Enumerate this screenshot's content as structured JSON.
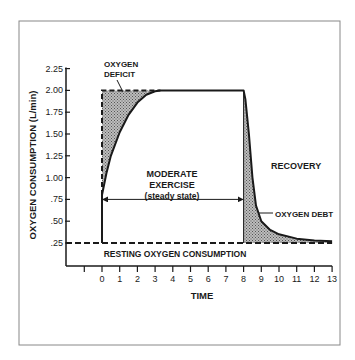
{
  "chart_data": {
    "type": "line",
    "title": "",
    "xlabel": "TIME",
    "ylabel": "OXYGEN CONSUMPTION (L/min)",
    "xlim": [
      -1,
      13
    ],
    "ylim": [
      0,
      2.25
    ],
    "x_ticks": [
      -1,
      0,
      1,
      2,
      3,
      4,
      5,
      6,
      7,
      8,
      9,
      10,
      11,
      12,
      13
    ],
    "x_tick_labels": [
      "",
      "0",
      "1",
      "2",
      "3",
      "4",
      "5",
      "6",
      "7",
      "8",
      "9",
      "10",
      "11",
      "12",
      "13"
    ],
    "y_ticks": [
      0.25,
      0.5,
      0.75,
      1.0,
      1.25,
      1.5,
      1.75,
      2.0,
      2.25
    ],
    "y_tick_labels": [
      ".25",
      ".50",
      ".75",
      "1.00",
      "1.25",
      "1.50",
      "1.75",
      "2.00",
      "2.25"
    ],
    "grid": false,
    "series": [
      {
        "name": "Oxygen consumption",
        "x": [
          0,
          0,
          0.25,
          0.5,
          1,
          1.5,
          2,
          2.5,
          3,
          3.3,
          8,
          8.1,
          8.3,
          8.5,
          8.7,
          9,
          9.5,
          10,
          11,
          12,
          13
        ],
        "y": [
          0.25,
          0.8,
          1.05,
          1.25,
          1.52,
          1.72,
          1.86,
          1.95,
          1.99,
          2.0,
          2.0,
          1.9,
          1.5,
          1.0,
          0.68,
          0.5,
          0.4,
          0.35,
          0.3,
          0.28,
          0.27
        ]
      },
      {
        "name": "Steady-state demand (dashed)",
        "x": [
          0,
          0,
          3.3
        ],
        "y": [
          0.25,
          2.0,
          2.0
        ]
      },
      {
        "name": "Resting oxygen consumption (dashed)",
        "x": [
          -1,
          13
        ],
        "y": [
          0.25,
          0.25
        ]
      }
    ],
    "shaded_regions": [
      {
        "name": "Oxygen deficit",
        "x_range": [
          0,
          3.3
        ]
      },
      {
        "name": "Oxygen debt",
        "x_range": [
          8,
          13
        ]
      }
    ],
    "annotations": {
      "oxygen_deficit": [
        "OXYGEN",
        "DEFICIT"
      ],
      "moderate_exercise": [
        "MODERATE",
        "EXERCISE",
        "(steady state)"
      ],
      "recovery": "RECOVERY",
      "oxygen_debt": "OXYGEN DEBT",
      "resting": "RESTING OXYGEN CONSUMPTION"
    },
    "exercise_arrow_range": [
      0,
      8
    ],
    "exercise_arrow_y": 0.75,
    "legend": "none"
  }
}
